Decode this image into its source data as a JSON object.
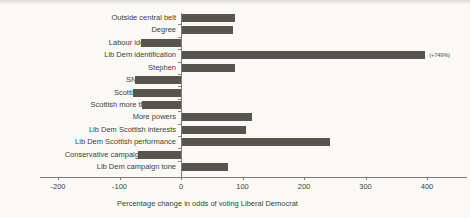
{
  "figure": {
    "xlabel": "Percentage change in odds of voting Liberal Democrat"
  },
  "chart_data": {
    "type": "bar",
    "orientation": "horizontal",
    "title": "",
    "xlabel": "Percentage change in odds of voting Liberal Democrat",
    "ylabel": "",
    "categories": [
      "Outside central belt",
      "Degree",
      "Labour identification",
      "Lib Dem identification",
      "Stephen",
      "SNP education",
      "Scottish not British",
      "Scottish more than British",
      "More powers",
      "Lib Dem Scottish interests",
      "Lib Dem Scottish performance",
      "Conservative campaign exposure",
      "Lib Dem campaign tone"
    ],
    "values": [
      88,
      85,
      -65,
      749,
      88,
      -75,
      -78,
      -63,
      115,
      106,
      242,
      -70,
      76
    ],
    "x_ticks": [
      -200,
      -100,
      0,
      100,
      200,
      300,
      400
    ],
    "xlim": [
      -230,
      465
    ],
    "bar_color": "#55554e",
    "grid": false,
    "legend": null,
    "annotations": [
      {
        "category_index": 3,
        "text": "(+749%)",
        "note": "bar clipped at axis maximum"
      }
    ]
  }
}
